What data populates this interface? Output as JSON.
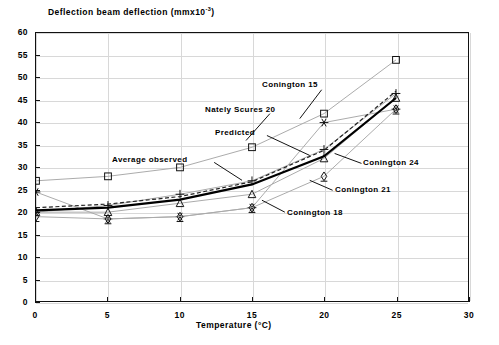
{
  "chart_data": {
    "type": "line",
    "title": "Deflection beam deflection (mmx10",
    "title_sup": "-3",
    "title_tail": ")",
    "xlabel": "Temperature (°C)",
    "ylabel": "",
    "xlim": [
      0,
      30
    ],
    "ylim": [
      0,
      60
    ],
    "xticks": [
      "0",
      "5",
      "10",
      "15",
      "20",
      "25",
      "30"
    ],
    "yticks": [
      "0",
      "5",
      "10",
      "15",
      "20",
      "25",
      "30",
      "35",
      "40",
      "45",
      "50",
      "55",
      "60"
    ],
    "grid": true,
    "legend_position": "inline-annotations",
    "x": [
      0,
      5,
      10,
      15,
      20,
      25
    ],
    "series": [
      {
        "name": "Nately Scures 20",
        "marker": "square",
        "values": [
          27.0,
          28.0,
          30.0,
          34.5,
          42.0,
          54.0
        ]
      },
      {
        "name": "Conington 15",
        "marker": "asterisk",
        "values": [
          24.5,
          18.5,
          19.0,
          21.0,
          40.0,
          43.0
        ]
      },
      {
        "name": "Conington 24",
        "marker": "plus",
        "values": [
          20.0,
          21.5,
          24.0,
          27.0,
          34.0,
          46.5
        ]
      },
      {
        "name": "Conington 21",
        "marker": "triangle",
        "values": [
          20.0,
          20.0,
          22.0,
          24.0,
          32.0,
          45.5
        ]
      },
      {
        "name": "Conington 18",
        "marker": "diamond",
        "values": [
          19.0,
          18.5,
          19.0,
          21.0,
          28.0,
          43.0
        ]
      },
      {
        "name": "Average observed",
        "marker": "none",
        "style": "solid-thick",
        "values": [
          20.4,
          21.0,
          22.8,
          26.2,
          32.5,
          45.5
        ]
      },
      {
        "name": "Predicted",
        "marker": "none",
        "style": "dashed",
        "values": [
          21.0,
          21.8,
          23.5,
          26.8,
          33.8,
          47.0
        ]
      }
    ],
    "annotations": [
      {
        "text": "Conington 15",
        "x": 262,
        "y": 80
      },
      {
        "text": "Nately Scures 20",
        "x": 205,
        "y": 105
      },
      {
        "text": "Predicted",
        "x": 215,
        "y": 128
      },
      {
        "text": "Average observed",
        "x": 112,
        "y": 155
      },
      {
        "text": "Conington 24",
        "x": 363,
        "y": 158
      },
      {
        "text": "Conington 21",
        "x": 335,
        "y": 185
      },
      {
        "text": "Conington 18",
        "x": 287,
        "y": 208
      }
    ]
  }
}
